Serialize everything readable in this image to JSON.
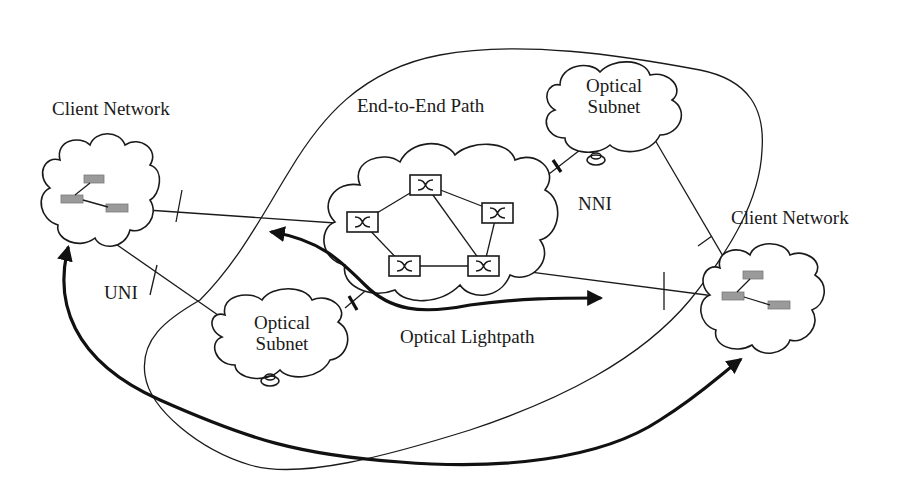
{
  "diagram": {
    "labels": {
      "client_network_left": "Client Network",
      "client_network_right": "Client Network",
      "end_to_end_path": "End-to-End Path",
      "optical_subnet_top_line1": "Optical",
      "optical_subnet_top_line2": "Subnet",
      "optical_subnet_bottom_line1": "Optical",
      "optical_subnet_bottom_line2": "Subnet",
      "nni": "NNI",
      "uni": "UNI",
      "optical_lightpath": "Optical Lightpath"
    },
    "nodes": [
      {
        "id": "client-left",
        "type": "cloud",
        "label": "Client Network",
        "routers": 3
      },
      {
        "id": "client-right",
        "type": "cloud",
        "label": "Client Network",
        "routers": 3
      },
      {
        "id": "core-cloud",
        "type": "cloud",
        "label": "",
        "switches": 5
      },
      {
        "id": "optical-subnet-top",
        "type": "cloud",
        "label": "Optical Subnet"
      },
      {
        "id": "optical-subnet-bottom",
        "type": "cloud",
        "label": "Optical Subnet"
      }
    ],
    "interfaces": [
      "UNI",
      "NNI"
    ],
    "arrows": [
      {
        "name": "optical-lightpath",
        "style": "bold",
        "bidirectional": true
      },
      {
        "name": "end-to-end-path",
        "style": "bold",
        "bidirectional": true,
        "from": "client-left",
        "to": "client-right"
      }
    ],
    "colors": {
      "stroke": "#1a1a1a",
      "router": "#9a9a9a",
      "background": "#ffffff"
    }
  }
}
